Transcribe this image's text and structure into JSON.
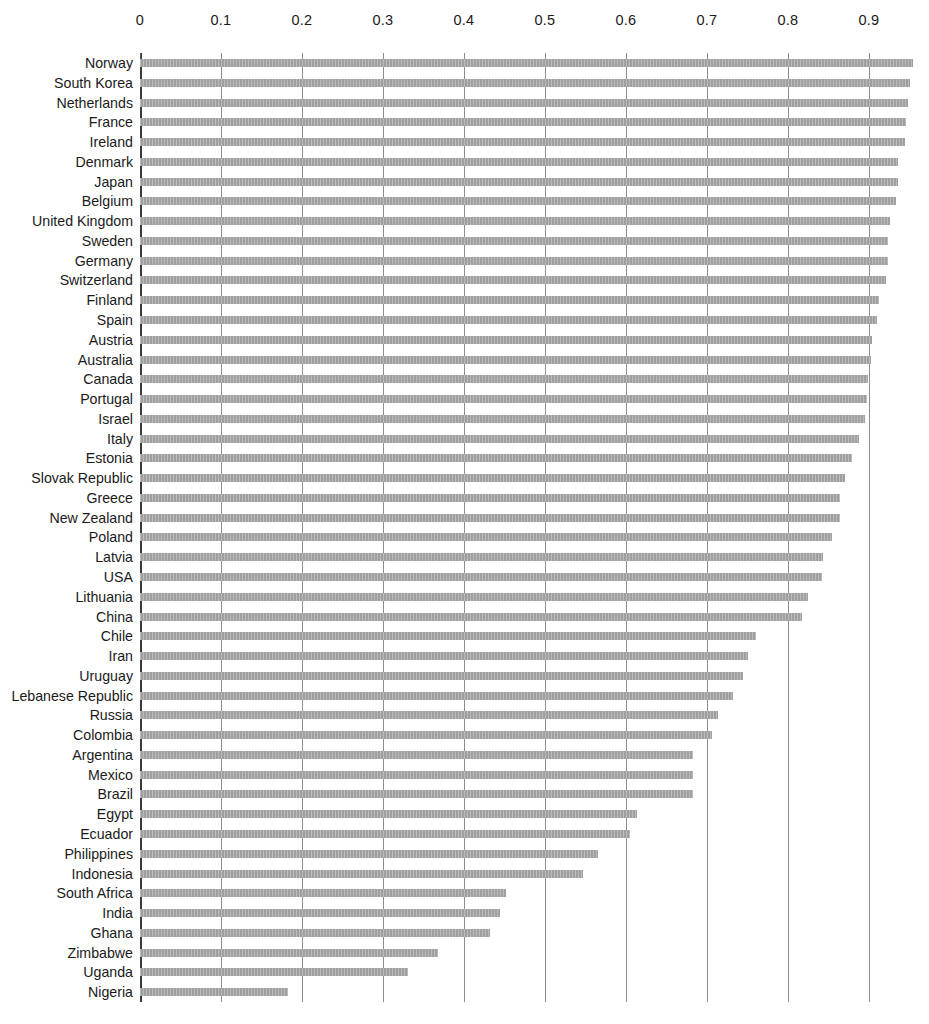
{
  "chart_data": {
    "type": "bar",
    "orientation": "horizontal",
    "title": "",
    "subtitle": "",
    "xlabel": "",
    "ylabel": "",
    "xlim": [
      0,
      0.95
    ],
    "xticks": [
      0,
      0.1,
      0.2,
      0.3,
      0.4,
      0.5,
      0.6,
      0.7,
      0.8,
      0.9
    ],
    "xtick_labels": [
      "0",
      "0.1",
      "0.2",
      "0.3",
      "0.4",
      "0.5",
      "0.6",
      "0.7",
      "0.8",
      "0.9"
    ],
    "grid": "vertical",
    "legend": "none",
    "bar_color": "#a8a8a8",
    "categories": [
      "Norway",
      "South Korea",
      "Netherlands",
      "France",
      "Ireland",
      "Denmark",
      "Japan",
      "Belgium",
      "United Kingdom",
      "Sweden",
      "Germany",
      "Switzerland",
      "Finland",
      "Spain",
      "Austria",
      "Australia",
      "Canada",
      "Portugal",
      "Israel",
      "Italy",
      "Estonia",
      "Slovak Republic",
      "Greece",
      "New Zealand",
      "Poland",
      "Latvia",
      "USA",
      "Lithuania",
      "China",
      "Chile",
      "Iran",
      "Uruguay",
      "Lebanese Republic",
      "Russia",
      "Colombia",
      "Argentina",
      "Mexico",
      "Brazil",
      "Egypt",
      "Ecuador",
      "Philippines",
      "Indonesia",
      "South Africa",
      "India",
      "Ghana",
      "Zimbabwe",
      "Uganda",
      "Nigeria"
    ],
    "values": [
      0.954,
      0.951,
      0.948,
      0.946,
      0.945,
      0.936,
      0.936,
      0.933,
      0.926,
      0.923,
      0.923,
      0.921,
      0.912,
      0.91,
      0.904,
      0.902,
      0.899,
      0.897,
      0.895,
      0.888,
      0.879,
      0.87,
      0.864,
      0.864,
      0.854,
      0.843,
      0.842,
      0.825,
      0.817,
      0.76,
      0.751,
      0.744,
      0.732,
      0.713,
      0.706,
      0.683,
      0.683,
      0.683,
      0.614,
      0.605,
      0.565,
      0.547,
      0.452,
      0.444,
      0.432,
      0.368,
      0.331,
      0.183
    ]
  },
  "geometry": {
    "plot_left_px": 140,
    "plot_top_px": 53,
    "px_per_unit": 810,
    "row_pitch_px": 19.77,
    "bar_height_px": 8,
    "plot_height_px": 949
  }
}
